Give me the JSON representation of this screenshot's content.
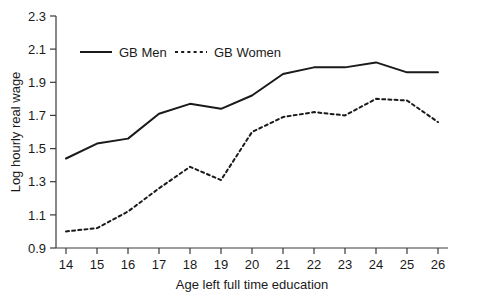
{
  "chart_data": {
    "type": "line",
    "title": "",
    "xlabel": "Age left full time education",
    "ylabel": "Log hourly real wage",
    "x": [
      14,
      15,
      16,
      17,
      18,
      19,
      20,
      21,
      22,
      23,
      24,
      25,
      26
    ],
    "xtick_labels": [
      "14",
      "15",
      "16",
      "17",
      "18",
      "19",
      "20",
      "21",
      "22",
      "23",
      "24",
      "25",
      "26"
    ],
    "ytick_labels": [
      "0.9",
      "1.1",
      "1.3",
      "1.5",
      "1.7",
      "1.9",
      "2.1",
      "2.3"
    ],
    "ytick_values": [
      0.9,
      1.1,
      1.3,
      1.5,
      1.7,
      1.9,
      2.1,
      2.3
    ],
    "xlim": [
      13.5,
      26.5
    ],
    "ylim": [
      0.9,
      2.3
    ],
    "grid": false,
    "legend_position": "top-left-inside",
    "series": [
      {
        "name": "GB Men",
        "style": "solid",
        "color": "#1a1a1a",
        "values": [
          1.44,
          1.53,
          1.56,
          1.71,
          1.77,
          1.74,
          1.82,
          1.95,
          1.99,
          1.99,
          2.02,
          1.96,
          1.96
        ]
      },
      {
        "name": "GB Women",
        "style": "dashed",
        "color": "#1a1a1a",
        "values": [
          1.0,
          1.02,
          1.12,
          1.26,
          1.39,
          1.31,
          1.6,
          1.69,
          1.72,
          1.7,
          1.8,
          1.79,
          1.66
        ]
      }
    ]
  },
  "legend": {
    "men_label": "GB Men",
    "women_label": "GB Women"
  },
  "axes": {
    "x_title": "Age left full time education",
    "y_title": "Log hourly real wage"
  }
}
